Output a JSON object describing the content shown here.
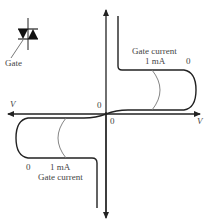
{
  "figure": {
    "type": "triac-iv-characteristic",
    "symbol": {
      "name": "triac",
      "gate_label": "Gate"
    },
    "axes": {
      "x_label_right": "V",
      "x_label_left": "V",
      "origin_label_upper": "0",
      "origin_label_lower": "0"
    },
    "quadrant_I": {
      "caption": "Gate current",
      "curve_labels": [
        "1 mA",
        "0"
      ]
    },
    "quadrant_III": {
      "caption": "Gate current",
      "curve_labels": [
        "0",
        "1 mA"
      ]
    },
    "colors": {
      "line": "#222222",
      "thin_curve": "#777777",
      "text": "#444444"
    }
  }
}
